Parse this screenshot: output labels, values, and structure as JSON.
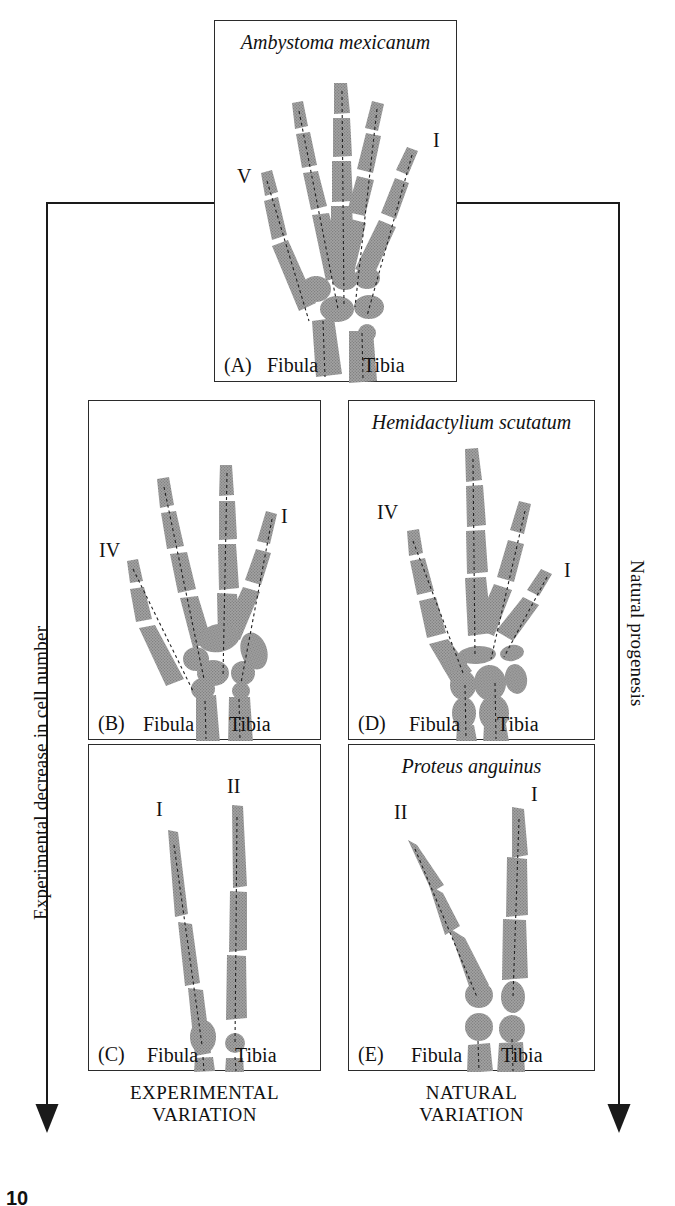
{
  "figure": {
    "page_number": "10",
    "left_axis_label": "Experimental decrease in cell number",
    "right_axis_label": "Natural progenesis",
    "column_captions": {
      "left": "EXPERIMENTAL\nVARIATION",
      "right": "NATURAL\nVARIATION"
    },
    "colors": {
      "bone_fill": "#9e9e9e",
      "bone_stipple": "#7d7d7d",
      "outline": "#2b2b2b",
      "axis_line": "#1a1a1a",
      "background": "#ffffff"
    }
  },
  "panels": [
    {
      "id": "A",
      "label": "(A)",
      "species": "Ambystoma mexicanum",
      "digit_labels": [
        "V",
        "I"
      ],
      "bone_labels": [
        "Fibula",
        "Tibia"
      ],
      "digit_count": 5,
      "description": "Normal axolotl hindlimb skeleton with five digits"
    },
    {
      "id": "B",
      "label": "(B)",
      "species": "",
      "digit_labels": [
        "IV",
        "I"
      ],
      "bone_labels": [
        "Fibula",
        "Tibia"
      ],
      "digit_count": 4,
      "description": "Experimentally reduced limb with four digits"
    },
    {
      "id": "C",
      "label": "(C)",
      "species": "",
      "digit_labels": [
        "I",
        "II"
      ],
      "bone_labels": [
        "Fibula",
        "Tibia"
      ],
      "digit_count": 2,
      "description": "Experimentally reduced limb with two digits"
    },
    {
      "id": "D",
      "label": "(D)",
      "species": "Hemidactylium scutatum",
      "digit_labels": [
        "IV",
        "I"
      ],
      "bone_labels": [
        "Fibula",
        "Tibia"
      ],
      "digit_count": 4,
      "description": "Natural four-toed salamander hindlimb"
    },
    {
      "id": "E",
      "label": "(E)",
      "species": "Proteus anguinus",
      "digit_labels": [
        "II",
        "I"
      ],
      "bone_labels": [
        "Fibula",
        "Tibia"
      ],
      "digit_count": 2,
      "description": "Natural olm hindlimb with two digits"
    }
  ]
}
